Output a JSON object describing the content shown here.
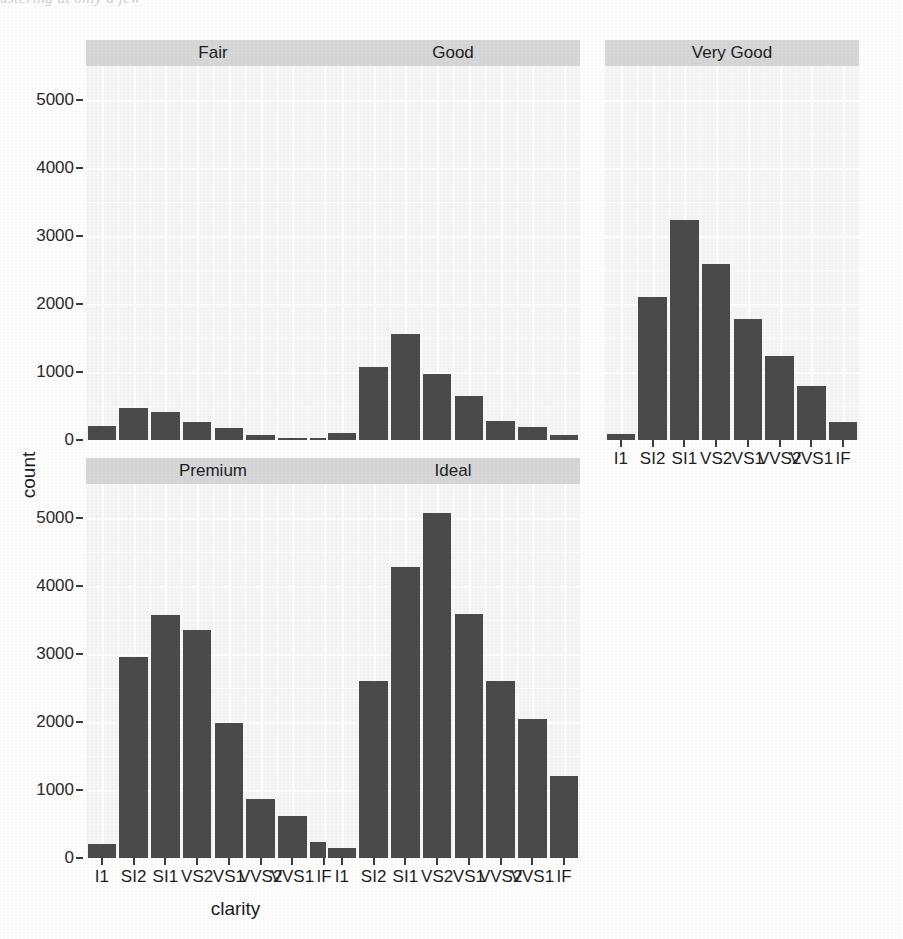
{
  "artifact": {
    "top_text": "ustering at only a few"
  },
  "chart_data": {
    "type": "bar",
    "title": "",
    "subtitle": "",
    "xlabel": "clarity",
    "ylabel": "count",
    "facet_variable": "cut",
    "facet_layout": "wrap, 3 columns x 2 rows",
    "grid": true,
    "legend": "none",
    "ylim": [
      0,
      5500
    ],
    "yticks": [
      0,
      1000,
      2000,
      3000,
      4000,
      5000
    ],
    "ytick_labels": [
      "0",
      "1000",
      "2000",
      "3000",
      "4000",
      "5000"
    ],
    "categories": [
      "I1",
      "SI2",
      "SI1",
      "VS2",
      "VS1",
      "VVS2",
      "VVS1",
      "IF"
    ],
    "bar_color": "#4b4b4b",
    "panel_bg": "#f7f7f7",
    "strip_bg": "#d8d8d8",
    "grid_color": "#ffffff",
    "panels": [
      {
        "label": "Fair",
        "row": 0,
        "col": 0,
        "values": [
          210,
          466,
          408,
          261,
          170,
          69,
          17,
          9
        ]
      },
      {
        "label": "Good",
        "row": 0,
        "col": 1,
        "values": [
          96,
          1081,
          1560,
          978,
          648,
          286,
          186,
          71
        ]
      },
      {
        "label": "Very Good",
        "row": 0,
        "col": 2,
        "values": [
          84,
          2100,
          3240,
          2591,
          1775,
          1235,
          789,
          268
        ]
      },
      {
        "label": "Premium",
        "row": 1,
        "col": 0,
        "values": [
          205,
          2949,
          3575,
          3357,
          1989,
          870,
          616,
          230
        ]
      },
      {
        "label": "Ideal",
        "row": 1,
        "col": 1,
        "values": [
          146,
          2598,
          4282,
          5071,
          3589,
          2606,
          2047,
          1212
        ]
      }
    ]
  }
}
